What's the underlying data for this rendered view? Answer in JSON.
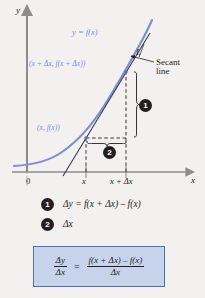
{
  "figure": {
    "type": "math-diagram",
    "topic": "difference-quotient-secant-line",
    "background_color": "#f2f1ef",
    "curve_color": "#7b8fd0",
    "axis_color": "#8c8c8c",
    "secant_color": "#3a3a52",
    "axes": {
      "y_label": "y",
      "x_label": "x",
      "origin_label": "0"
    },
    "ticks": {
      "x": "x",
      "x_plus_dx": "x + Δx"
    },
    "labels": {
      "curve": "y = f(x)",
      "point_first": "(x, f(x))",
      "point_second": "(x + Δx, f(x + Δx))",
      "secant_name": "L",
      "secant_line_1": "Secant",
      "secant_line_2": "line"
    },
    "callouts": [
      {
        "number": "1",
        "label": "Δy = f(x + Δx) – f(x)"
      },
      {
        "number": "2",
        "label": "Δx"
      }
    ],
    "formula": {
      "background_color": "#c6d3ea",
      "border_color": "#4d6fae",
      "left_numerator": "Δy",
      "left_denominator": "Δx",
      "equals": "=",
      "right_numerator": "f(x + Δx) – f(x)",
      "right_denominator": "Δx"
    }
  }
}
